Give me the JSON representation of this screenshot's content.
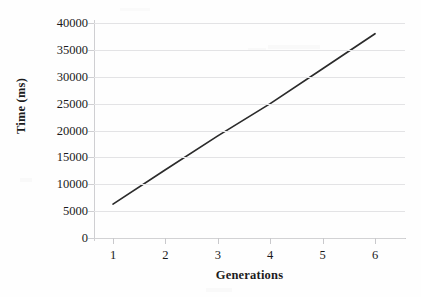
{
  "figure": {
    "background_color": "#fefefe",
    "line_color": "#2b2b2b",
    "gridline_color": "#e3e3e5",
    "axis_color": "#cfcfd2",
    "text_color": "#1a1a1a"
  },
  "chart_data": {
    "type": "line",
    "title": "",
    "xlabel": "Generations",
    "ylabel": "Time (ms)",
    "categories": [
      "1",
      "2",
      "3",
      "4",
      "5",
      "6"
    ],
    "x": [
      1,
      2,
      3,
      4,
      5,
      6
    ],
    "values": [
      6300,
      12700,
      19000,
      25000,
      31500,
      38000
    ],
    "series": [
      {
        "name": "Time (ms)",
        "values": [
          6300,
          12700,
          19000,
          25000,
          31500,
          38000
        ],
        "color": "#2b2b2b"
      }
    ],
    "ylim": [
      0,
      40000
    ],
    "ytick_step": 5000,
    "yticks": [
      0,
      5000,
      10000,
      15000,
      20000,
      25000,
      30000,
      35000,
      40000
    ],
    "ytick_labels": [
      "0",
      "5000",
      "10000",
      "15000",
      "20000",
      "25000",
      "30000",
      "35000",
      "40000"
    ],
    "xticks": [
      1,
      2,
      3,
      4,
      5,
      6
    ],
    "xtick_labels": [
      "1",
      "2",
      "3",
      "4",
      "5",
      "6"
    ],
    "grid": true,
    "grid_axis": "y",
    "legend": false,
    "legend_position": "none",
    "markers": false,
    "annotations": []
  }
}
